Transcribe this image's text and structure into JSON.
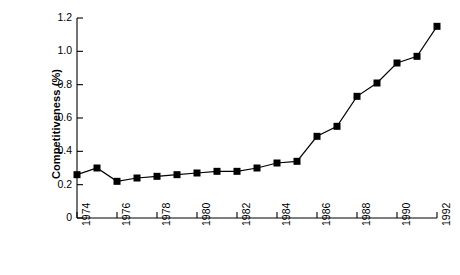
{
  "chart_data": {
    "type": "line",
    "title": "",
    "subtitle": "",
    "xlabel": "",
    "ylabel": "Competitiveness (%)",
    "x": [
      1974,
      1975,
      1976,
      1977,
      1978,
      1979,
      1980,
      1981,
      1982,
      1983,
      1984,
      1985,
      1986,
      1987,
      1988,
      1989,
      1990,
      1991,
      1992
    ],
    "values": [
      0.26,
      0.3,
      0.22,
      0.24,
      0.25,
      0.26,
      0.27,
      0.28,
      0.28,
      0.3,
      0.33,
      0.34,
      0.49,
      0.55,
      0.73,
      0.81,
      0.93,
      0.97,
      1.15
    ],
    "series": [
      {
        "name": "Competitiveness",
        "values": [
          0.26,
          0.3,
          0.22,
          0.24,
          0.25,
          0.26,
          0.27,
          0.28,
          0.28,
          0.3,
          0.33,
          0.34,
          0.49,
          0.55,
          0.73,
          0.81,
          0.93,
          0.97,
          1.15
        ],
        "marker": "square",
        "marker_color": "#000000",
        "line_color": "#000000"
      }
    ],
    "xlim": [
      1974,
      1992
    ],
    "ylim": [
      0,
      1.2
    ],
    "ytick_labels": [
      "0",
      "0.2",
      "0.4",
      "0.6",
      "0.8",
      "1.0",
      "1.2"
    ],
    "ytick_values": [
      0,
      0.2,
      0.4,
      0.6,
      0.8,
      1.0,
      1.2
    ],
    "xtick_labels": [
      "1974",
      "1976",
      "1978",
      "1980",
      "1982",
      "1984",
      "1986",
      "1988",
      "1990",
      "1992"
    ],
    "xtick_values": [
      1974,
      1976,
      1978,
      1980,
      1982,
      1984,
      1986,
      1988,
      1990,
      1992
    ],
    "xtick_rotation": -90,
    "grid": false,
    "legend": false,
    "legend_position": "none",
    "annotations": []
  }
}
